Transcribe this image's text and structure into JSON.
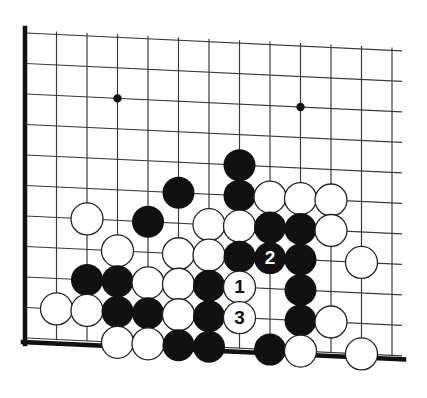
{
  "figure": {
    "kind": "go-board-diagram",
    "board": {
      "columns": 13,
      "rows": 11,
      "cell_size": 30.5,
      "origin_x": 26,
      "origin_y": 33,
      "skew_y_per_column": 1.45,
      "line_color": "#3a3a3a",
      "edge_color": "#111111",
      "edge_width": 4.5,
      "line_width": 1.2,
      "background_color": "#ffffff",
      "left_edge": true,
      "bottom_edge": true,
      "top_edge_partial": true
    },
    "star_points": [
      {
        "col": 3,
        "row": 2
      },
      {
        "col": 9,
        "row": 2
      }
    ],
    "stone_style": {
      "radius": 16,
      "black_fill": "#111111",
      "white_fill": "#ffffff",
      "white_stroke": "#222222",
      "white_stroke_width": 1.3,
      "label_on_black_color": "#ffffff",
      "label_on_white_color": "#111111",
      "label_font_size": 19
    },
    "stones": [
      {
        "col": 7,
        "row": 4,
        "color": "black"
      },
      {
        "col": 5,
        "row": 5,
        "color": "black"
      },
      {
        "col": 7,
        "row": 5,
        "color": "black"
      },
      {
        "col": 8,
        "row": 5,
        "color": "white"
      },
      {
        "col": 9,
        "row": 5,
        "color": "white"
      },
      {
        "col": 10,
        "row": 5,
        "color": "white"
      },
      {
        "col": 2,
        "row": 6,
        "color": "white"
      },
      {
        "col": 4,
        "row": 6,
        "color": "black"
      },
      {
        "col": 6,
        "row": 6,
        "color": "white"
      },
      {
        "col": 7,
        "row": 6,
        "color": "white"
      },
      {
        "col": 8,
        "row": 6,
        "color": "black"
      },
      {
        "col": 9,
        "row": 6,
        "color": "black"
      },
      {
        "col": 10,
        "row": 6,
        "color": "white"
      },
      {
        "col": 3,
        "row": 7,
        "color": "white"
      },
      {
        "col": 5,
        "row": 7,
        "color": "white"
      },
      {
        "col": 6,
        "row": 7,
        "color": "white"
      },
      {
        "col": 7,
        "row": 7,
        "color": "black"
      },
      {
        "col": 8,
        "row": 7,
        "color": "black",
        "label": "2"
      },
      {
        "col": 9,
        "row": 7,
        "color": "black"
      },
      {
        "col": 11,
        "row": 7,
        "color": "white"
      },
      {
        "col": 2,
        "row": 8,
        "color": "black"
      },
      {
        "col": 3,
        "row": 8,
        "color": "black"
      },
      {
        "col": 4,
        "row": 8,
        "color": "white"
      },
      {
        "col": 5,
        "row": 8,
        "color": "white"
      },
      {
        "col": 6,
        "row": 8,
        "color": "black"
      },
      {
        "col": 7,
        "row": 8,
        "color": "white",
        "label": "1"
      },
      {
        "col": 9,
        "row": 8,
        "color": "black"
      },
      {
        "col": 1,
        "row": 9,
        "color": "white"
      },
      {
        "col": 2,
        "row": 9,
        "color": "white"
      },
      {
        "col": 3,
        "row": 9,
        "color": "black"
      },
      {
        "col": 4,
        "row": 9,
        "color": "black"
      },
      {
        "col": 5,
        "row": 9,
        "color": "white"
      },
      {
        "col": 6,
        "row": 9,
        "color": "black"
      },
      {
        "col": 7,
        "row": 9,
        "color": "white",
        "label": "3"
      },
      {
        "col": 9,
        "row": 9,
        "color": "black"
      },
      {
        "col": 10,
        "row": 9,
        "color": "white"
      },
      {
        "col": 3,
        "row": 10,
        "color": "white"
      },
      {
        "col": 4,
        "row": 10,
        "color": "white"
      },
      {
        "col": 5,
        "row": 10,
        "color": "black"
      },
      {
        "col": 6,
        "row": 10,
        "color": "black"
      },
      {
        "col": 8,
        "row": 10,
        "color": "black"
      },
      {
        "col": 9,
        "row": 10,
        "color": "white"
      },
      {
        "col": 11,
        "row": 10,
        "color": "white"
      }
    ],
    "move_sequence": [
      {
        "number": "1",
        "color": "white"
      },
      {
        "number": "2",
        "color": "black"
      },
      {
        "number": "3",
        "color": "white"
      }
    ]
  }
}
